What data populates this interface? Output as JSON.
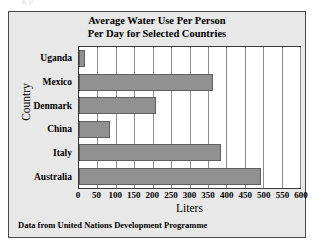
{
  "page": {
    "top_fragment": "g  p"
  },
  "chart_data": {
    "type": "bar",
    "orientation": "horizontal",
    "title": "Average Water Use Per Person Per Day for Selected Countries",
    "title_lines": [
      "Average Water Use Per Person",
      "Per Day for Selected Countries"
    ],
    "categories": [
      "Uganda",
      "Mexico",
      "Denmark",
      "China",
      "Italy",
      "Australia"
    ],
    "values": [
      15,
      365,
      210,
      85,
      385,
      495
    ],
    "xlabel": "Liters",
    "ylabel": "Country",
    "xlim": [
      0,
      600
    ],
    "ylim": null,
    "xticks": [
      0,
      50,
      100,
      150,
      200,
      250,
      300,
      350,
      400,
      450,
      500,
      550,
      600
    ],
    "xtick_labels": [
      "0",
      "50",
      "100",
      "150",
      "200",
      "250",
      "300",
      "350",
      "400",
      "450",
      "500",
      "550",
      "600"
    ],
    "grid": true,
    "grid_axis": "x",
    "legend": null,
    "bar_color": "#919191",
    "bar_edge_color": "#5f5f5f",
    "plot_background": "#ffffff",
    "panel_background": "#e8e8e8",
    "source_note": "Data from United Nations Development Programme"
  }
}
